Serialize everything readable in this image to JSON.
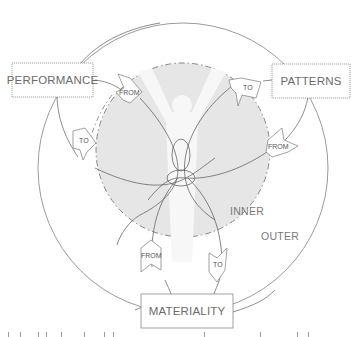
{
  "diagram": {
    "colors": {
      "line": "#707070",
      "inner_fill": "#e6e6e6",
      "figure_fill": "#f7f7f7",
      "box_border": "#8a8a8a",
      "text": "#6b6b6b"
    },
    "nodes": {
      "performance": {
        "label": "PERFORMANCE"
      },
      "patterns": {
        "label": "PATTERNS"
      },
      "materiality": {
        "label": "MATERIALITY"
      }
    },
    "zones": {
      "inner": {
        "label": "INNER"
      },
      "outer": {
        "label": "OUTER"
      }
    },
    "arrows": {
      "performance_from": {
        "label": "FROM"
      },
      "performance_to": {
        "label": "TO"
      },
      "patterns_to": {
        "label": "TO"
      },
      "patterns_from": {
        "label": "FROM"
      },
      "materiality_from": {
        "label": "FROM"
      },
      "materiality_to": {
        "label": "TO"
      }
    }
  }
}
